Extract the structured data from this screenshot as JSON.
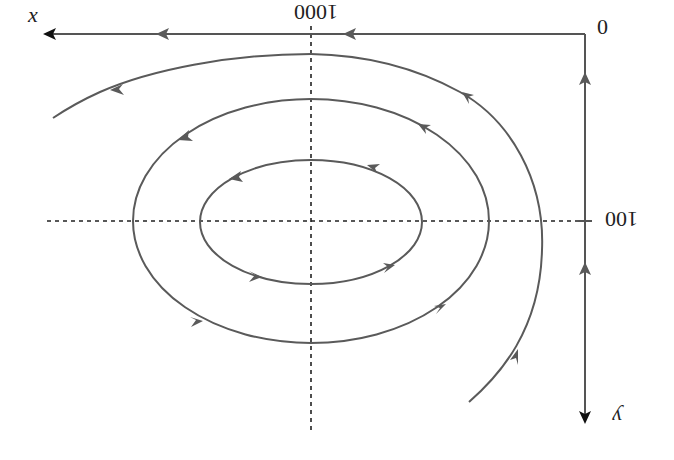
{
  "diagram": {
    "type": "phase-portrait",
    "colors": {
      "curve": "#5a5a5a",
      "axis": "#555555",
      "dashed_guides": "#222222",
      "background": "#ffffff"
    },
    "labels": {
      "x_axis": "x",
      "y_axis": "y",
      "origin": "0",
      "x_tick": "1000",
      "y_tick": "100"
    },
    "label_orientation": {
      "x_tick": "rotated 180°",
      "y_tick": "rotated 180°",
      "y_axis": "rotated 180°"
    },
    "center_point": {
      "x": 1000,
      "y": 100
    },
    "orbits": [
      {
        "name": "inner-ellipse",
        "closed": true,
        "direction": "counterclockwise-on-screen"
      },
      {
        "name": "middle-ellipse",
        "closed": true,
        "direction": "counterclockwise-on-screen"
      },
      {
        "name": "outer-trajectory",
        "closed": false,
        "direction": "from bottom-right, up and over to the left"
      }
    ],
    "boundary_flow": {
      "top_edge": "flows left toward x arrow",
      "right_edge": "flows up toward origin 0"
    },
    "bottom_caption": "(cropped, illegible)"
  }
}
